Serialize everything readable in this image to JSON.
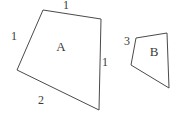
{
  "figure": {
    "canvas": {
      "width": 178,
      "height": 121,
      "background": "#ffffff"
    },
    "stroke_color": "#4a4a4a",
    "text_color": "#3a3a3a"
  },
  "shapes": [
    {
      "id": "shape-a",
      "name": "A",
      "type": "quadrilateral",
      "points": "43,10 101,19 99,110 17,70",
      "label": {
        "text": "A",
        "x": 61,
        "y": 46
      },
      "sides": [
        {
          "edge": "top",
          "text": "1",
          "x": 66,
          "y": 5
        },
        {
          "edge": "left",
          "text": "1",
          "x": 14,
          "y": 36
        },
        {
          "edge": "right",
          "text": "1",
          "x": 105,
          "y": 62
        },
        {
          "edge": "bottom",
          "text": "2",
          "x": 41,
          "y": 100
        }
      ]
    },
    {
      "id": "shape-b",
      "name": "B",
      "type": "quadrilateral",
      "points": "136,38 167,33 169,88 131,65",
      "label": {
        "text": "B",
        "x": 154,
        "y": 51
      },
      "sides": [
        {
          "edge": "upper-left",
          "text": "3",
          "x": 127,
          "y": 41
        }
      ]
    }
  ]
}
